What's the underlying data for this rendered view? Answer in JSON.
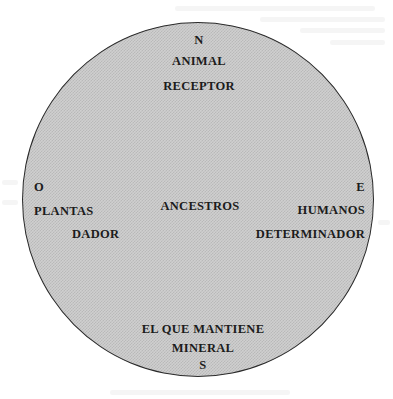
{
  "diagram": {
    "type": "cardinal-circle",
    "fill_color": "#c8c8c8",
    "border_color": "#2a2a2a",
    "north": {
      "direction": "N",
      "lines": [
        "ANIMAL",
        "RECEPTOR"
      ]
    },
    "west": {
      "direction": "O",
      "lines": [
        "PLANTAS",
        "DADOR"
      ]
    },
    "east": {
      "direction": "E",
      "lines": [
        "HUMANOS",
        "DETERMINADOR"
      ]
    },
    "south": {
      "lines": [
        "EL QUE MANTIENE",
        "MINERAL"
      ],
      "direction": "S"
    },
    "center": {
      "label": "ANCESTROS"
    }
  }
}
